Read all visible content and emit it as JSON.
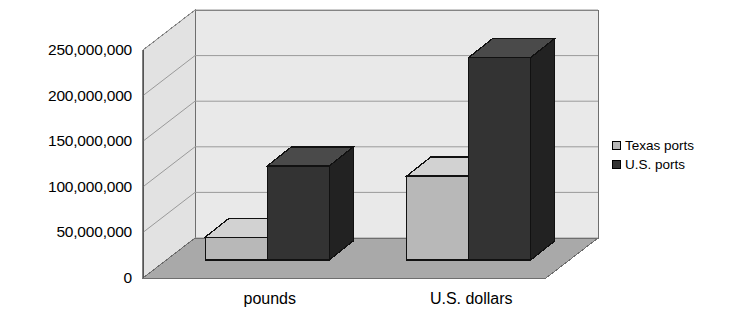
{
  "chart_data": {
    "type": "bar",
    "title": "",
    "subtitle": "",
    "xlabel": "",
    "ylabel": "",
    "categories": [
      "pounds",
      "U.S. dollars"
    ],
    "series": [
      {
        "name": "Texas ports",
        "values": [
          25000000,
          92000000
        ],
        "color": "#b8b8b8"
      },
      {
        "name": "U.S. ports",
        "values": [
          103000000,
          222000000
        ],
        "color": "#333333"
      }
    ],
    "ylim": [
      0,
      250000000
    ],
    "ytick_values": [
      0,
      50000000,
      100000000,
      150000000,
      200000000,
      250000000
    ],
    "ytick_labels": [
      "0",
      "50,000,000",
      "100,000,000",
      "150,000,000",
      "200,000,000",
      "250,000,000"
    ],
    "grid": true,
    "legend_position": "right",
    "three_d": true,
    "annotations": []
  },
  "legend": {
    "entries": [
      {
        "label": "Texas ports"
      },
      {
        "label": "U.S. ports"
      }
    ]
  },
  "colors": {
    "bar_light": "#b8b8b8",
    "bar_light_top": "#d2d2d2",
    "bar_light_side": "#9c9c9c",
    "bar_dark": "#333333",
    "bar_dark_top": "#4a4a4a",
    "bar_dark_side": "#222222",
    "wall_back": "#e9e9e9",
    "wall_side": "#e2e2e2",
    "floor": "#a9a9a9",
    "gridline": "#9a9a9a",
    "axis": "#6e6e6e",
    "text": "#000000",
    "background": "#ffffff"
  }
}
